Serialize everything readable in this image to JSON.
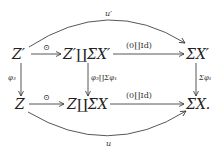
{
  "diagram": {
    "type": "commutative-diagram",
    "nodes": {
      "top_left": "Z′",
      "top_mid": "Z′∐ΣX′",
      "top_right": "ΣX′",
      "bot_left": "Z",
      "bot_mid": "Z∐ΣX",
      "bot_right": "ΣX."
    },
    "arrows": {
      "top_left_to_mid": "⊙",
      "top_mid_to_right": "(0∐Id)",
      "bot_left_to_mid": "⊙",
      "bot_mid_to_right": "(0∐Id)",
      "left_vertical": "φ₃",
      "mid_vertical": "φ₃∐Σφ₁",
      "right_vertical": "Σφ₁",
      "top_curve": "u′",
      "bot_curve": "u"
    },
    "colors": {
      "ink": "#222222",
      "background": "#ffffff"
    }
  }
}
